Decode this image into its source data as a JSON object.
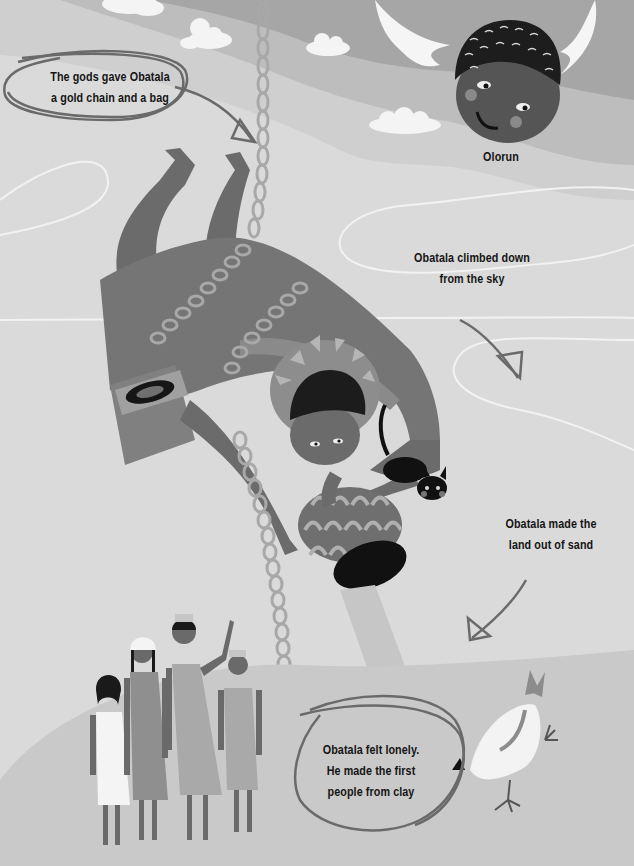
{
  "page": {
    "style": "grayscale children's book illustration",
    "colors": {
      "sky_dark": "#a6a6a6",
      "sky_mid": "#bdbdbd",
      "sky_light": "#cfcfcf",
      "background": "#dadada",
      "ground": "#c9c9c9",
      "skin": "#6e6e6e",
      "robe": "#737373",
      "chain": "#a8a8a8",
      "outline_circle": "#6a6a6a",
      "text": "#151515"
    }
  },
  "characters": {
    "olorun": {
      "label": "Olorun"
    },
    "obatala": {
      "label": "Obatala"
    },
    "cat": {
      "label": "cat"
    },
    "hen": {
      "label": "hen"
    },
    "people": [
      {
        "label": "person-1",
        "dress": "white"
      },
      {
        "label": "person-2",
        "dress": "gray"
      },
      {
        "label": "person-3",
        "dress": "light-gray",
        "waving": true
      },
      {
        "label": "person-4",
        "dress": "light-gray"
      }
    ]
  },
  "captions": {
    "gods_gift": {
      "line1": "The gods gave Obatala",
      "line2": "a gold chain and a bag"
    },
    "olorun": "Olorun",
    "climbed": {
      "line1": "Obatala climbed down",
      "line2": "from the sky"
    },
    "land": {
      "line1": "Obatala made the",
      "line2": "land out of sand"
    },
    "lonely": {
      "line1": "Obatala felt lonely.",
      "line2": "He made the first",
      "line3": "people from clay"
    }
  }
}
